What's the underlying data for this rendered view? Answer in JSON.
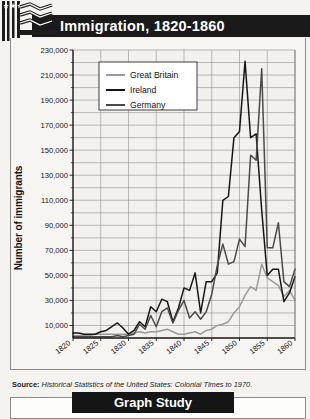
{
  "header": {
    "title": "Immigration, 1820-1860",
    "logo_icon": "us-flag-icon"
  },
  "footer": {
    "label": "Graph Study"
  },
  "source": {
    "prefix": "Source:",
    "text": "Historical Statistics of the United States: Colonial Times to 1970."
  },
  "chart_data": {
    "type": "line",
    "title": "Immigration, 1820-1860",
    "xlabel": "Year",
    "ylabel": "Number of immigrants",
    "xlim": [
      1820,
      1860
    ],
    "ylim": [
      0,
      230000
    ],
    "ytick_labels": [
      "230,000",
      "210,000",
      "190,000",
      "170,000",
      "150,000",
      "130,000",
      "110,000",
      "90,000",
      "70,000",
      "50,000",
      "30,000",
      "10,000"
    ],
    "ytick_values": [
      230000,
      210000,
      190000,
      170000,
      150000,
      130000,
      110000,
      90000,
      70000,
      50000,
      30000,
      10000
    ],
    "yminor_step": 10000,
    "xtick_labels": [
      "1820",
      "1825",
      "1830",
      "1835",
      "1840",
      "1845",
      "1850",
      "1855",
      "1860"
    ],
    "xtick_values": [
      1820,
      1825,
      1830,
      1835,
      1840,
      1845,
      1850,
      1855,
      1860
    ],
    "grid": true,
    "legend_position": "upper-left-inside",
    "colors": {
      "great_britain": "#9a9a9a",
      "ireland": "#161616",
      "germany": "#4a4a4a"
    },
    "x": [
      1820,
      1821,
      1822,
      1823,
      1824,
      1825,
      1826,
      1827,
      1828,
      1829,
      1830,
      1831,
      1832,
      1833,
      1834,
      1835,
      1836,
      1837,
      1838,
      1839,
      1840,
      1841,
      1842,
      1843,
      1844,
      1845,
      1846,
      1847,
      1848,
      1849,
      1850,
      1851,
      1852,
      1853,
      1854,
      1855,
      1856,
      1857,
      1858,
      1859,
      1860
    ],
    "series": [
      {
        "name": "Great Britain",
        "color": "#9a9a9a",
        "values": [
          2000,
          2000,
          2000,
          2000,
          3000,
          3000,
          3000,
          3000,
          3000,
          3000,
          3000,
          4000,
          5000,
          4000,
          5000,
          5000,
          6000,
          7000,
          5000,
          3000,
          3000,
          4000,
          5000,
          3000,
          6000,
          7000,
          10000,
          11000,
          13000,
          20000,
          25000,
          34000,
          41000,
          38000,
          59000,
          48000,
          45000,
          42000,
          33000,
          38000,
          30000
        ]
      },
      {
        "name": "Ireland",
        "color": "#161616",
        "values": [
          4000,
          4000,
          3000,
          3000,
          3000,
          5000,
          6000,
          9000,
          12000,
          8000,
          3000,
          6000,
          13000,
          9000,
          25000,
          21000,
          31000,
          29000,
          13000,
          24000,
          40000,
          38000,
          52000,
          20000,
          45000,
          45000,
          52000,
          110000,
          113000,
          160000,
          165000,
          221000,
          160000,
          163000,
          102000,
          50000,
          55000,
          55000,
          29000,
          36000,
          49000
        ]
      },
      {
        "name": "Germany",
        "color": "#4a4a4a",
        "values": [
          1000,
          1000,
          1000,
          1000,
          1000,
          1000,
          1000,
          1000,
          2000,
          1000,
          2000,
          3000,
          11000,
          7000,
          18000,
          9000,
          21000,
          24000,
          12000,
          22000,
          30000,
          16000,
          21000,
          15000,
          21000,
          35000,
          58000,
          75000,
          59000,
          61000,
          79000,
          73000,
          146000,
          142000,
          215000,
          72000,
          72000,
          92000,
          45000,
          41000,
          55000
        ]
      }
    ]
  }
}
